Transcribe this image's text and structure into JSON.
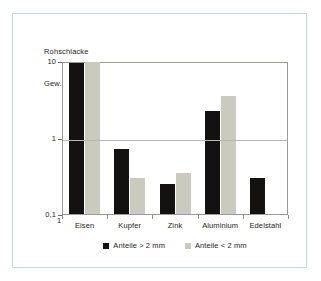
{
  "chart_data": {
    "type": "bar",
    "title": "Rohschlacke",
    "subtitle": "Gew.-%",
    "ylabel": "Gew.-%",
    "xlabel": "",
    "yscale": "log",
    "ylim": [
      0.1,
      10
    ],
    "ytick_labels": [
      "10",
      "1",
      "0,1"
    ],
    "ytick_values": [
      10,
      1,
      0.1
    ],
    "origin_label": "1",
    "grid": true,
    "legend_position": "bottom",
    "categories": [
      "Eisen",
      "Kupfer",
      "Zink",
      "Aluminium",
      "Edelstahl"
    ],
    "series": [
      {
        "name": "Anteile > 2 mm",
        "color": "#131211",
        "values": [
          9.5,
          0.7,
          0.25,
          2.2,
          0.3
        ]
      },
      {
        "name": "Anteile < 2 mm",
        "color": "#cbcabf",
        "values": [
          9.8,
          0.3,
          0.34,
          3.5,
          null
        ]
      }
    ]
  },
  "colors": {
    "series_dark": "#131211",
    "series_light": "#cbcabf",
    "frame": "#bcd9e4",
    "axis": "#9c9a93",
    "grid": "#b9b7b0",
    "text": "#262322",
    "background": "#ffffff"
  }
}
